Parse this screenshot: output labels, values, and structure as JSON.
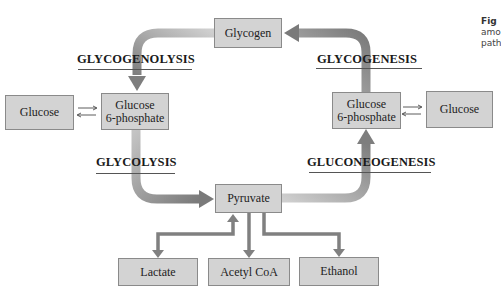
{
  "diagram": {
    "nodes": {
      "glycogen": "Glycogen",
      "glucose_left": "Glucose",
      "g6p_left_line1": "Glucose",
      "g6p_left_line2": "6-phosphate",
      "g6p_right_line1": "Glucose",
      "g6p_right_line2": "6-phosphate",
      "glucose_right": "Glucose",
      "pyruvate": "Pyruvate",
      "lactate": "Lactate",
      "acetyl_coa": "Acetyl CoA",
      "ethanol": "Ethanol"
    },
    "pathways": {
      "glycogenolysis": "GLYCOGENOLYSIS",
      "glycogenesis": "GLYCOGENESIS",
      "glycolysis": "GLYCOLYSIS",
      "gluconeogenesis": "GLUCONEOGENESIS"
    },
    "caption": {
      "line1": "Fig",
      "line2": "amo",
      "line3": "path"
    },
    "colors": {
      "box_fill": "#d3d3d3",
      "box_border": "#8a8a8a",
      "arrow_dark": "#7d7d7d",
      "arrow_light": "#c8c8c8"
    }
  }
}
